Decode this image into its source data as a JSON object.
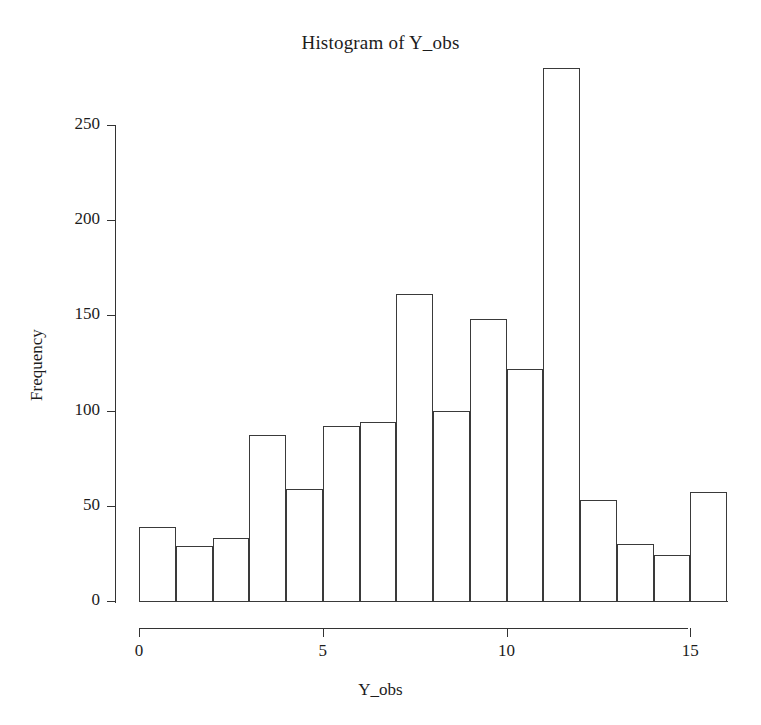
{
  "chart_data": {
    "type": "bar",
    "title": "Histogram of Y_obs",
    "xlabel": "Y_obs",
    "ylabel": "Frequency",
    "bin_width": 1,
    "bin_edges": [
      0,
      1,
      2,
      3,
      4,
      5,
      6,
      7,
      8,
      9,
      10,
      11,
      12,
      13,
      14,
      15,
      16
    ],
    "categories": [
      "0-1",
      "1-2",
      "2-3",
      "3-4",
      "4-5",
      "5-6",
      "6-7",
      "7-8",
      "8-9",
      "9-10",
      "10-11",
      "11-12",
      "12-13",
      "13-14",
      "14-15",
      "15-16"
    ],
    "values": [
      39,
      29,
      33,
      87,
      59,
      92,
      94,
      161,
      100,
      148,
      122,
      280,
      53,
      30,
      24,
      57
    ],
    "xlim": [
      0,
      16
    ],
    "ylim": [
      0,
      285
    ],
    "x_ticks": [
      0,
      5,
      10,
      15
    ],
    "x_tick_labels": [
      "0",
      "5",
      "10",
      "15"
    ],
    "y_ticks": [
      0,
      50,
      100,
      150,
      200,
      250
    ],
    "y_tick_labels": [
      "0",
      "50",
      "100",
      "150",
      "200",
      "250"
    ],
    "grid": false,
    "legend": "none",
    "bar_fill": "#ffffff",
    "bar_edge_color": "#3a3a3a",
    "axis_color": "#333333",
    "text_color": "#1c1c1c",
    "background": "#ffffff"
  }
}
